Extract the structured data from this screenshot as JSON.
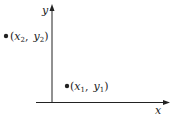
{
  "diagram": {
    "type": "coordinate-plane",
    "axes": {
      "x_label": "x",
      "y_label": "y"
    },
    "points": [
      {
        "name": "point-1",
        "x_sym": "x",
        "x_sub": "1",
        "y_sym": "y",
        "y_sub": "1",
        "open": "(",
        "sep": ",",
        "close": ")"
      },
      {
        "name": "point-2",
        "x_sym": "x",
        "x_sub": "2",
        "y_sym": "y",
        "y_sub": "2",
        "open": "(",
        "sep": ",",
        "close": ")"
      }
    ],
    "colors": {
      "ink": "#222222",
      "background": "#ffffff"
    }
  }
}
